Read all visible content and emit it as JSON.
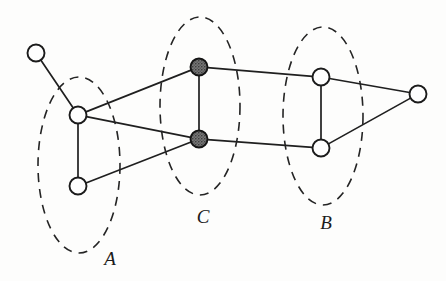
{
  "figure": {
    "kind": "graph-diagram",
    "width": 446,
    "height": 281,
    "background_color": "#fdfdfc",
    "stroke_color": "#1f1f1f",
    "filled_node_color": "#6a6a6a",
    "open_node_color": "#fefefe",
    "dash_pattern": "9 7"
  },
  "groups": [
    {
      "id": "A",
      "label": "A",
      "label_x": 110,
      "label_y": 265,
      "ellipse": {
        "cx": 79,
        "cy": 165,
        "rx": 41,
        "ry": 88,
        "rotation": 0
      }
    },
    {
      "id": "C",
      "label": "C",
      "label_x": 203,
      "label_y": 223,
      "ellipse": {
        "cx": 200,
        "cy": 106,
        "rx": 40,
        "ry": 89,
        "rotation": 0
      }
    },
    {
      "id": "B",
      "label": "B",
      "label_x": 326,
      "label_y": 229,
      "ellipse": {
        "cx": 323,
        "cy": 116,
        "rx": 40,
        "ry": 89,
        "rotation": 0
      }
    }
  ],
  "nodes": [
    {
      "id": "n0",
      "label": "",
      "x": 36,
      "y": 53,
      "r": 8.5,
      "style": "open",
      "group": null
    },
    {
      "id": "a1",
      "label": "",
      "x": 78,
      "y": 115,
      "r": 8.5,
      "style": "open",
      "group": "A"
    },
    {
      "id": "a2",
      "label": "",
      "x": 78,
      "y": 186,
      "r": 8.5,
      "style": "open",
      "group": "A"
    },
    {
      "id": "c1",
      "label": "",
      "x": 199,
      "y": 67,
      "r": 8.5,
      "style": "filled",
      "group": "C"
    },
    {
      "id": "c2",
      "label": "",
      "x": 199,
      "y": 139,
      "r": 8.5,
      "style": "filled",
      "group": "C"
    },
    {
      "id": "b1",
      "label": "",
      "x": 321,
      "y": 77,
      "r": 8.5,
      "style": "open",
      "group": "B"
    },
    {
      "id": "b2",
      "label": "",
      "x": 321,
      "y": 148,
      "r": 8.5,
      "style": "open",
      "group": "B"
    },
    {
      "id": "n7",
      "label": "",
      "x": 418,
      "y": 94,
      "r": 8.5,
      "style": "open",
      "group": null
    }
  ],
  "edges": [
    {
      "from": "n0",
      "to": "a1"
    },
    {
      "from": "a1",
      "to": "a2"
    },
    {
      "from": "a1",
      "to": "c1"
    },
    {
      "from": "a1",
      "to": "c2"
    },
    {
      "from": "a2",
      "to": "c2"
    },
    {
      "from": "c1",
      "to": "c2"
    },
    {
      "from": "c1",
      "to": "b1"
    },
    {
      "from": "c2",
      "to": "b2"
    },
    {
      "from": "b1",
      "to": "b2"
    },
    {
      "from": "b1",
      "to": "n7"
    },
    {
      "from": "b2",
      "to": "n7"
    }
  ]
}
